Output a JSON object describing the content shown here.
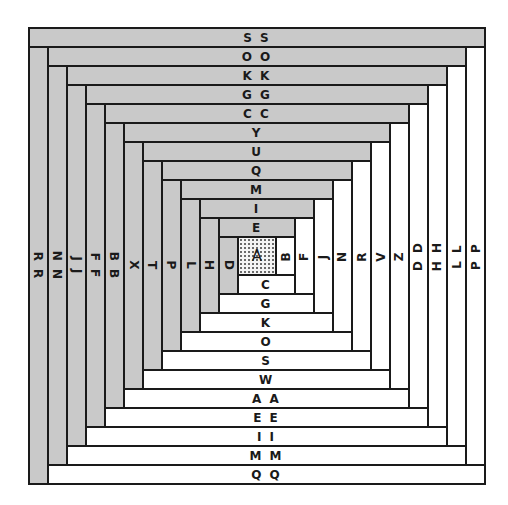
{
  "diagram": {
    "type": "log-cabin-quilt-block",
    "center_label": "A",
    "colors": {
      "dark": "#c9c9c9",
      "light": "#ffffff",
      "line": "#1a1a1a",
      "center_pattern": "dotted"
    },
    "strip_order": [
      "A",
      "B",
      "C",
      "D",
      "E",
      "F",
      "G",
      "H",
      "I",
      "J",
      "K",
      "L",
      "M",
      "N",
      "O",
      "P",
      "Q",
      "R",
      "S",
      "T",
      "U",
      "V",
      "W",
      "X",
      "Y",
      "Z",
      "AA",
      "BB",
      "CC",
      "DD",
      "EE",
      "FF",
      "GG",
      "HH",
      "II",
      "JJ",
      "KK",
      "LL",
      "MM",
      "NN",
      "OO",
      "PP",
      "QQ",
      "RR",
      "SS"
    ],
    "top_strips": [
      "E",
      "I",
      "M",
      "Q",
      "U",
      "Y",
      "CC",
      "GG",
      "KK",
      "OO",
      "SS"
    ],
    "right_strips": [
      "B",
      "F",
      "J",
      "N",
      "R",
      "V",
      "Z",
      "DD",
      "HH",
      "LL",
      "PP"
    ],
    "bottom_strips": [
      "C",
      "G",
      "K",
      "O",
      "S",
      "W",
      "AA",
      "EE",
      "II",
      "MM",
      "QQ"
    ],
    "left_strips": [
      "D",
      "H",
      "L",
      "P",
      "T",
      "X",
      "BB",
      "FF",
      "JJ",
      "NN",
      "RR"
    ],
    "display_labels": {
      "A": "A",
      "B": "B",
      "C": "C",
      "D": "D",
      "E": "E",
      "F": "F",
      "G": "G",
      "H": "H",
      "I": "I",
      "J": "J",
      "K": "K",
      "L": "L",
      "M": "M",
      "N": "N",
      "O": "O",
      "P": "P",
      "Q": "Q",
      "R": "R",
      "S": "S",
      "T": "T",
      "U": "U",
      "V": "V",
      "W": "W",
      "X": "X",
      "Y": "Y",
      "Z": "Z",
      "AA": "A A",
      "BB": "B B",
      "CC": "C C",
      "DD": "D D",
      "EE": "E E",
      "FF": "F F",
      "GG": "G G",
      "HH": "H H",
      "II": "I I",
      "JJ": "J J",
      "KK": "K K",
      "LL": "L L",
      "MM": "M M",
      "NN": "N N",
      "OO": "O O",
      "PP": "P P",
      "QQ": "Q Q",
      "RR": "R R",
      "SS": "S S"
    }
  }
}
